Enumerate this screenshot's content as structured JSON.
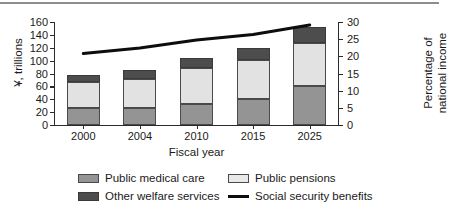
{
  "chart_data": {
    "type": "bar",
    "title": "",
    "subtitle": "",
    "xlabel": "Fiscal year",
    "ylabel": "¥, trillions",
    "ylabel_right_line1": "Percentage of",
    "ylabel_right_line2": "national income",
    "categories": [
      "2000",
      "2004",
      "2010",
      "2015",
      "2025"
    ],
    "ylim": [
      0,
      160
    ],
    "yticks": [
      0,
      20,
      40,
      60,
      80,
      100,
      120,
      140,
      160
    ],
    "ylim_right": [
      0,
      30
    ],
    "yticks_right": [
      0,
      5,
      10,
      15,
      20,
      25,
      30
    ],
    "grid": false,
    "legend_position": "bottom",
    "stacked": true,
    "series": [
      {
        "name": "Public medical care",
        "color": "#949494",
        "values": [
          26,
          26,
          33,
          41,
          61
        ]
      },
      {
        "name": "Public pensions",
        "color": "#e2e2e2",
        "values": [
          41,
          45,
          55,
          60,
          66
        ]
      },
      {
        "name": "Other welfare services",
        "color": "#4d4d4d",
        "values": [
          11,
          14,
          16,
          18,
          25
        ]
      }
    ],
    "totals": [
      78,
      85,
      104,
      119,
      152
    ],
    "line_series": {
      "name": "Social security benefits",
      "color": "#0d0d0d",
      "axis": "right",
      "unit": "%",
      "values": [
        20.8,
        22.4,
        24.8,
        26.4,
        29.1
      ]
    }
  },
  "axes": {
    "left_ticks": [
      "160",
      "140",
      "120",
      "100",
      "80",
      "60",
      "40",
      "20",
      "0"
    ],
    "right_ticks": [
      "30",
      "25",
      "20",
      "15",
      "10",
      "5",
      "0"
    ],
    "x_ticks": [
      "2000",
      "2004",
      "2010",
      "2015",
      "2025"
    ],
    "x_title": "Fiscal year",
    "y_title_left": "¥, trillions",
    "y_title_right_top": "Percentage of",
    "y_title_right_bottom": "national income"
  },
  "legend": {
    "items": [
      {
        "label": "Public medical care",
        "swatch": "medical",
        "kind": "box"
      },
      {
        "label": "Public pensions",
        "swatch": "pensions",
        "kind": "box"
      },
      {
        "label": "Other welfare services",
        "swatch": "other",
        "kind": "box"
      },
      {
        "label": "Social security benefits",
        "swatch": "line",
        "kind": "line"
      }
    ]
  }
}
